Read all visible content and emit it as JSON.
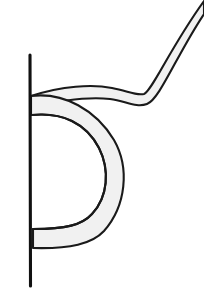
{
  "figure": {
    "alt_text": "Hand-drawn letter-b like glyph with shaded ribbon",
    "background_color": "#ffffff",
    "canvas": {
      "width": 204,
      "height": 296
    },
    "strokes": {
      "outline_color": "#1a1a1a",
      "outline_width": 2.1,
      "stem_color": "#111111",
      "stem_width": 3.1
    },
    "fills": {
      "ribbon_fill": "#f1f1f1",
      "ribbon_fill_alt": "#ededed",
      "interior_void": "#ffffff"
    },
    "parts": [
      {
        "name": "vertical-stem",
        "label": "Vertical stem",
        "x": 30,
        "y_top": 55,
        "y_bottom": 286,
        "width": 3
      },
      {
        "name": "bowl-ribbon",
        "label": "Bowl ribbon",
        "attach_top_y": 97,
        "attach_bottom_y": 247,
        "rightmost_x": 126,
        "thickness": 19
      },
      {
        "name": "tail-ribbon",
        "label": "Tail ribbon",
        "start_x": 32,
        "start_y": 92,
        "elbow_x": 146,
        "elbow_y": 90,
        "end_x": 204,
        "end_y": 2,
        "thickness": 11
      }
    ],
    "geometry": {
      "bowl_outer_path": "M 31 96 C 64 92 96 110 114 140 C 130 168 126 206 104 231 C 92 244 70 249 33 248 L 33 229 C 66 229 82 225 92 214 C 108 197 110 170 99 148 C 86 123 62 112 31 115 Z",
      "bowl_inner_highlight": "M 33 115 C 62 112 86 123 99 148 C 110 170 108 197 92 214 C 82 225 66 229 33 229",
      "tail_path_outer": "M 31 96 C 62 86 92 84 112 88 C 128 91 136 96 144 94 C 152 91 170 48 204 1 L 204 14 C 176 56 160 99 147 104 C 136 108 126 101 110 99 C 92 97 62 100 31 107 Z",
      "stem_path": "M 30 55 L 30.5 286",
      "tail_tip_clip": "M 190 0 L 204 0 L 204 16 Z"
    }
  }
}
